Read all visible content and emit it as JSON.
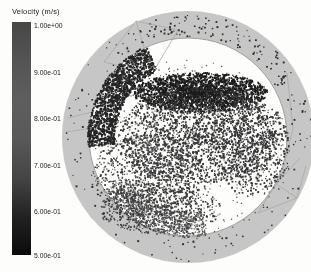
{
  "legend": {
    "title": "Velocity (m/s)",
    "tick_labels": [
      "1.00e+00",
      "9.00e-01",
      "8.00e-01",
      "7.00e-01",
      "6.00e-01",
      "5.00e-01"
    ],
    "colorbar_gradient": [
      "#474747",
      "#545454",
      "#5e5e5e",
      "#595959",
      "#454545",
      "#222222",
      "#0b0b0b"
    ]
  },
  "chart_data": {
    "type": "scatter",
    "title": "Velocity (m/s)",
    "colorbar": {
      "label": "Velocity (m/s)",
      "min": 0.5,
      "max": 1.0,
      "tick_values": [
        1.0,
        0.9,
        0.8,
        0.7,
        0.6,
        0.5
      ],
      "tick_labels": [
        "1.00e+00",
        "9.00e-01",
        "8.00e-01",
        "7.00e-01",
        "6.00e-01",
        "5.00e-01"
      ],
      "orientation": "vertical",
      "position": "left"
    },
    "legend_position": "top-left",
    "grid": false,
    "axes_visible": false
  },
  "visualization": {
    "background": "#fdfdfc",
    "drum": {
      "cx": 188,
      "cy": 137,
      "outer_radius": 126,
      "inner_radius": 99,
      "ring_color": "#c6c6c6",
      "inner_line_color": "#9f9f9f"
    },
    "ripple_arcs": {
      "radii": [
        76,
        80,
        84,
        88,
        92,
        96,
        100
      ],
      "angle_start": 80,
      "angle_end": 148,
      "color": "#9b9b9b",
      "dash": [
        3,
        2
      ],
      "line_width": 1.1
    },
    "mesh_lines": {
      "color": "#a8a8a8",
      "line_width": 0.8,
      "segments": [
        [
          104,
          62,
          136,
          21
        ],
        [
          136,
          21,
          152,
          74
        ],
        [
          152,
          74,
          104,
          62
        ],
        [
          136,
          21,
          178,
          30
        ],
        [
          152,
          74,
          178,
          30
        ],
        [
          287,
          73,
          293,
          128
        ],
        [
          293,
          128,
          283,
          170
        ],
        [
          258,
          213,
          276,
          184
        ],
        [
          276,
          184,
          297,
          198
        ],
        [
          297,
          198,
          258,
          213
        ],
        [
          276,
          184,
          300,
          158
        ],
        [
          297,
          198,
          306,
          166
        ],
        [
          68,
          118,
          92,
          112
        ],
        [
          66,
          132,
          92,
          128
        ]
      ]
    },
    "particle_clusters": [
      {
        "type": "ellipse",
        "cx": 200,
        "cy": 92,
        "rx": 67,
        "ry": 20,
        "count": 2400,
        "color": "#1c1c1c",
        "pow": 0.75,
        "smin": 1,
        "smax": 2.2
      },
      {
        "type": "ellipse",
        "cx": 198,
        "cy": 135,
        "rx": 80,
        "ry": 48,
        "count": 2000,
        "color": "#333333",
        "pow": 0.6,
        "smin": 1,
        "smax": 2
      },
      {
        "type": "ellipse",
        "cx": 148,
        "cy": 175,
        "rx": 58,
        "ry": 42,
        "count": 800,
        "color": "#3d3d3d",
        "pow": 0.6,
        "smin": 1,
        "smax": 2
      },
      {
        "type": "ellipse",
        "cx": 160,
        "cy": 208,
        "rx": 60,
        "ry": 26,
        "count": 700,
        "color": "#383838",
        "pow": 0.6,
        "smin": 1,
        "smax": 1.8
      },
      {
        "type": "ellipse",
        "cx": 252,
        "cy": 148,
        "rx": 38,
        "ry": 48,
        "count": 600,
        "color": "#353535",
        "pow": 0.6,
        "smin": 1,
        "smax": 2
      },
      {
        "type": "ellipse",
        "cx": 188,
        "cy": 150,
        "rx": 95,
        "ry": 92,
        "count": 450,
        "color": "#555555",
        "pow": 0.5,
        "smin": 1,
        "smax": 1.4
      },
      {
        "type": "annulus",
        "cx": 188,
        "cy": 137,
        "r0": 74,
        "r1": 101,
        "a0": 175,
        "a1": 245,
        "count": 1500,
        "color": "#242424",
        "smin": 1,
        "smax": 2.2
      },
      {
        "type": "annulus",
        "cx": 188,
        "cy": 137,
        "r0": 74,
        "r1": 100,
        "a0": 80,
        "a1": 148,
        "count": 500,
        "color": "#4a4a4a",
        "smin": 1,
        "smax": 1.6
      },
      {
        "type": "annulus",
        "cx": 188,
        "cy": 137,
        "r0": 101,
        "r1": 124,
        "a0": 0,
        "a1": 360,
        "count": 160,
        "color": "#2e2e2e",
        "smin": 1,
        "smax": 2
      },
      {
        "type": "annulus",
        "cx": 188,
        "cy": 137,
        "r0": 103,
        "r1": 122,
        "a0": 230,
        "a1": 330,
        "count": 70,
        "color": "#303030",
        "smin": 1,
        "smax": 2
      }
    ]
  }
}
